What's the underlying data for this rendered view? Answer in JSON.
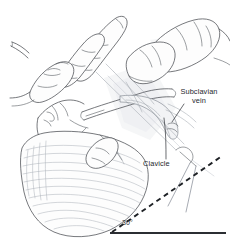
{
  "figure": {
    "background_color": "#ffffff",
    "ink_color": "#3c3f45",
    "annotation_color": "#25282d",
    "width": 230,
    "height": 243
  },
  "labels": {
    "subclavian_vein": "Subclavian\nvein",
    "clavicle": "Clavicle",
    "angle": "30°"
  },
  "anatomy": [
    {
      "name": "operator-hand",
      "label": "Operator hand and fingers"
    },
    {
      "name": "patient-head",
      "label": "Patient head in profile"
    },
    {
      "name": "chest-wall",
      "label": "Chest wall with hatching"
    },
    {
      "name": "clavicle-bone",
      "label": "Clavicle"
    },
    {
      "name": "subclavian-vein-vessel",
      "label": "Subclavian vein"
    },
    {
      "name": "shoulder-arm",
      "label": "Shoulder and upper arm"
    },
    {
      "name": "needle-syringe",
      "label": "Needle and syringe"
    }
  ],
  "geometry": {
    "angle_value": "30°",
    "reference_line": "horizontal frontal plane",
    "angled_line": "needle trajectory (dashed)"
  }
}
